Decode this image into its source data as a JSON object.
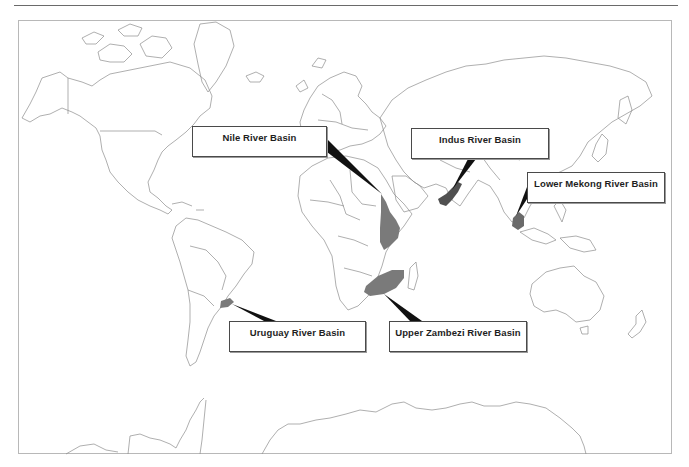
{
  "map": {
    "projection": "world outline",
    "land_stroke": "#8c8c8c",
    "basin_fill": "#7a7a7a",
    "basin_dark_fill": "#505050",
    "leader_fill": "#111111"
  },
  "labels": [
    {
      "id": "nile",
      "text": "Nile River Basin",
      "box": [
        192,
        126,
        135,
        31
      ]
    },
    {
      "id": "indus",
      "text": "Indus River Basin",
      "box": [
        411,
        128,
        138,
        31
      ]
    },
    {
      "id": "mekong",
      "text": "Lower Mekong River Basin",
      "box": [
        527,
        172,
        138,
        31
      ]
    },
    {
      "id": "uruguay",
      "text": "Uruguay River Basin",
      "box": [
        229,
        321,
        137,
        31
      ]
    },
    {
      "id": "zambezi",
      "text": "Upper Zambezi River Basin",
      "box": [
        389,
        321,
        138,
        31
      ]
    }
  ]
}
